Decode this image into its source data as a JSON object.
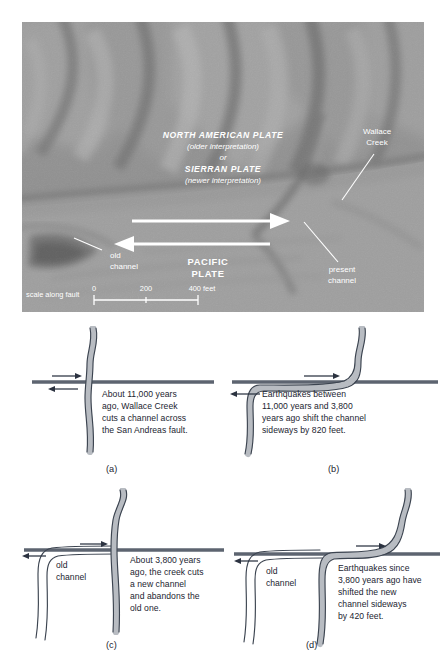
{
  "figure": {
    "type": "geology-diagram"
  },
  "photo": {
    "plate_north_american": "NORTH AMERICAN PLATE",
    "plate_north_american_note": "(older interpretation)",
    "plate_or": "or",
    "plate_sierran": "SIERRAN PLATE",
    "plate_sierran_note": "(newer interpretation)",
    "plate_pacific_line1": "PACIFIC",
    "plate_pacific_line2": "PLATE",
    "wallace_creek_line1": "Wallace",
    "wallace_creek_line2": "Creek",
    "present_channel_line1": "present",
    "present_channel_line2": "channel",
    "old_channel_line1": "old",
    "old_channel_line2": "channel",
    "scale_caption": "scale along fault",
    "scale_ticks": [
      "0",
      "200",
      "400 feet"
    ]
  },
  "panels": [
    {
      "key": "a",
      "label": "(a)",
      "caption": "About 11,000 years ago, Wallace Creek cuts a channel across the San Andreas fault.",
      "caption_lines": [
        "About 11,000 years",
        "ago, Wallace Creek",
        "cuts a channel across",
        "the San Andreas fault."
      ],
      "old_channel_label": "",
      "offset_feet": 0
    },
    {
      "key": "b",
      "label": "(b)",
      "caption": "Earthquakes between 11,000 years and 3,800 years ago shift the channel sideways by 820 feet.",
      "caption_lines": [
        "Earthquakes between",
        "11,000 years and 3,800",
        "years ago shift the channel",
        "sideways by 820 feet."
      ],
      "old_channel_label": "",
      "offset_feet": 820
    },
    {
      "key": "c",
      "label": "(c)",
      "caption": "About 3,800 years ago, the creek cuts a new channel and abandons the old one.",
      "caption_lines": [
        "About 3,800 years",
        "ago, the creek cuts",
        "a new channel",
        "and abandons the",
        "old one."
      ],
      "old_channel_label_line1": "old",
      "old_channel_label_line2": "channel",
      "offset_feet": 0
    },
    {
      "key": "d",
      "label": "(d)",
      "caption": "Earthquakes since 3,800 years ago have shifted the new channel sideways by 420 feet.",
      "caption_lines": [
        "Earthquakes since",
        "3,800 years ago have",
        "shifted the new",
        "channel sideways",
        "by 420 feet."
      ],
      "old_channel_label_line1": "old",
      "old_channel_label_line2": "channel",
      "offset_feet": 420
    }
  ],
  "colors": {
    "channel_fill": "#b8bcc2",
    "channel_edge": "#3c4450",
    "fault": "#5d6470",
    "photo_label": "#ffffff",
    "text": "#1b2430"
  }
}
